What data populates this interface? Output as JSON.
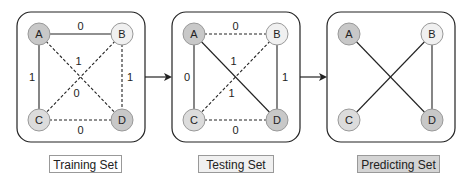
{
  "panels": [
    {
      "name": "training",
      "label": "Training Set",
      "label_bg": "#ffffff",
      "edges": [
        {
          "from": "A",
          "to": "B",
          "style": "solid",
          "weight": "0"
        },
        {
          "from": "A",
          "to": "C",
          "style": "solid",
          "weight": "1"
        },
        {
          "from": "A",
          "to": "D",
          "style": "dashed",
          "weight": "1"
        },
        {
          "from": "B",
          "to": "C",
          "style": "dashed",
          "weight": "0"
        },
        {
          "from": "B",
          "to": "D",
          "style": "dashed",
          "weight": "1"
        },
        {
          "from": "C",
          "to": "D",
          "style": "dashed",
          "weight": "0"
        }
      ]
    },
    {
      "name": "testing",
      "label": "Testing Set",
      "label_bg": "#f0f0f0",
      "edges": [
        {
          "from": "A",
          "to": "B",
          "style": "dashed",
          "weight": "0"
        },
        {
          "from": "A",
          "to": "C",
          "style": "solid",
          "weight": "0"
        },
        {
          "from": "A",
          "to": "D",
          "style": "solid",
          "weight": "1"
        },
        {
          "from": "B",
          "to": "C",
          "style": "dashed",
          "weight": "1"
        },
        {
          "from": "B",
          "to": "D",
          "style": "solid",
          "weight": "1"
        },
        {
          "from": "C",
          "to": "D",
          "style": "dashed",
          "weight": "0"
        }
      ]
    },
    {
      "name": "predicting",
      "label": "Predicting Set",
      "label_bg": "#d4d4d4",
      "edges": [
        {
          "from": "A",
          "to": "D",
          "style": "solid",
          "weight": ""
        },
        {
          "from": "B",
          "to": "C",
          "style": "solid",
          "weight": ""
        },
        {
          "from": "B",
          "to": "D",
          "style": "solid",
          "weight": ""
        }
      ]
    }
  ],
  "nodes": {
    "A": {
      "label": "A",
      "fill": "#c8c8c8"
    },
    "B": {
      "label": "B",
      "fill": "#f0f0f0"
    },
    "C": {
      "label": "C",
      "fill": "#dcdcdc"
    },
    "D": {
      "label": "D",
      "fill": "#c8c8c8"
    }
  },
  "labels": {
    "training": "Training Set",
    "testing": "Testing Set",
    "predicting": "Predicting Set"
  }
}
